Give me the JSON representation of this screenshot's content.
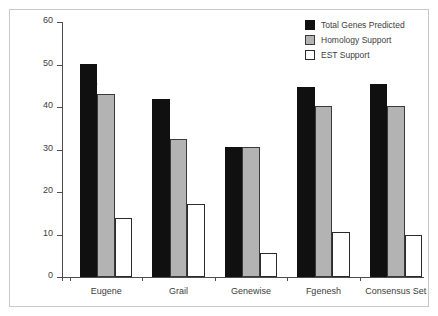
{
  "chart_data": {
    "type": "bar",
    "title": "",
    "xlabel": "",
    "ylabel": "Number of Genes (Thousands)",
    "categories": [
      "Eugene",
      "Grail",
      "Genewise",
      "Fgenesh",
      "Consensus Set"
    ],
    "series": [
      {
        "name": "Total Genes Predicted",
        "color": "#101010",
        "values": [
          50.1,
          42.0,
          30.6,
          44.7,
          45.3
        ]
      },
      {
        "name": "Homology Support",
        "color": "#b3b3b3",
        "values": [
          43.0,
          32.5,
          30.5,
          40.3,
          40.2
        ]
      },
      {
        "name": "EST Support",
        "color": "#ffffff",
        "values": [
          13.8,
          17.1,
          5.6,
          10.5,
          10.0
        ]
      }
    ],
    "ylim": [
      0,
      60
    ],
    "yticks": [
      0,
      10,
      20,
      30,
      40,
      50,
      60
    ],
    "ytick_labels": [
      "0",
      "10",
      "20",
      "30",
      "40",
      "50",
      "60"
    ],
    "grid": false,
    "legend_position": "top-right"
  },
  "legend": {
    "items": [
      {
        "label": "Total Genes Predicted",
        "swatch": "black-square-icon"
      },
      {
        "label": "Homology Support",
        "swatch": "gray-square-icon"
      },
      {
        "label": "EST Support",
        "swatch": "white-square-icon"
      }
    ]
  },
  "colors": {
    "total": "#101010",
    "homology": "#b3b3b3",
    "est": "#ffffff",
    "axis": "#4d4d4d",
    "frame": "#c8c8c8",
    "text": "#3d3d3d"
  }
}
